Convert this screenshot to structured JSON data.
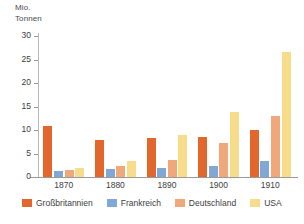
{
  "chart_data": {
    "type": "bar",
    "title": "",
    "subtitle": "",
    "xlabel": "",
    "ylabel": "Mio.\nTonnen",
    "ylabel_lines": [
      "Mio.",
      "Tonnen"
    ],
    "categories": [
      "1870",
      "1880",
      "1890",
      "1900",
      "1910"
    ],
    "ylim": [
      0,
      30
    ],
    "yticks": [
      0,
      5,
      10,
      15,
      20,
      25,
      30
    ],
    "ytick_labels": [
      "0",
      "5",
      "10",
      "15",
      "20",
      "25",
      "30"
    ],
    "grid": false,
    "legend_position": "bottom",
    "series": [
      {
        "name": "Großbritannien",
        "color": "#E2672C",
        "values": [
          10.9,
          7.9,
          8.2,
          8.6,
          10.0
        ]
      },
      {
        "name": "Frankreich",
        "color": "#7FA8D6",
        "values": [
          1.3,
          1.6,
          2.0,
          2.3,
          3.4
        ]
      },
      {
        "name": "Deutschland",
        "color": "#F0A87A",
        "values": [
          1.4,
          2.4,
          3.6,
          7.2,
          13.0
        ]
      },
      {
        "name": "USA",
        "color": "#F7DC8C",
        "values": [
          1.9,
          3.5,
          9.0,
          13.8,
          26.7
        ]
      }
    ]
  }
}
